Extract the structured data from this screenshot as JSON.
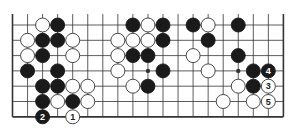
{
  "diagram": {
    "type": "go-board-fragment",
    "columns": 19,
    "rows_shown": 7,
    "edges": [
      "left",
      "right",
      "bottom"
    ],
    "colors": {
      "line": "#333333",
      "black_stone": "#1a1a1a",
      "white_stone": "#ffffff",
      "background": "#ffffff"
    },
    "star_points": [
      {
        "col": 9,
        "row": 3
      },
      {
        "col": 15,
        "row": 3
      }
    ],
    "stones": [
      {
        "col": 2,
        "row": 0,
        "color": "white"
      },
      {
        "col": 3,
        "row": 0,
        "color": "black"
      },
      {
        "col": 8,
        "row": 0,
        "color": "black"
      },
      {
        "col": 9,
        "row": 0,
        "color": "white"
      },
      {
        "col": 10,
        "row": 0,
        "color": "black"
      },
      {
        "col": 12,
        "row": 0,
        "color": "black"
      },
      {
        "col": 13,
        "row": 0,
        "color": "white"
      },
      {
        "col": 15,
        "row": 0,
        "color": "black"
      },
      {
        "col": 1,
        "row": 1,
        "color": "white"
      },
      {
        "col": 2,
        "row": 1,
        "color": "black"
      },
      {
        "col": 3,
        "row": 1,
        "color": "black"
      },
      {
        "col": 4,
        "row": 1,
        "color": "white"
      },
      {
        "col": 7,
        "row": 1,
        "color": "white"
      },
      {
        "col": 8,
        "row": 1,
        "color": "white"
      },
      {
        "col": 9,
        "row": 1,
        "color": "white"
      },
      {
        "col": 10,
        "row": 1,
        "color": "black"
      },
      {
        "col": 13,
        "row": 1,
        "color": "black"
      },
      {
        "col": 1,
        "row": 2,
        "color": "white"
      },
      {
        "col": 2,
        "row": 2,
        "color": "black"
      },
      {
        "col": 4,
        "row": 2,
        "color": "white"
      },
      {
        "col": 7,
        "row": 2,
        "color": "white"
      },
      {
        "col": 8,
        "row": 2,
        "color": "black"
      },
      {
        "col": 9,
        "row": 2,
        "color": "black"
      },
      {
        "col": 12,
        "row": 2,
        "color": "white"
      },
      {
        "col": 15,
        "row": 2,
        "color": "black"
      },
      {
        "col": 1,
        "row": 3,
        "color": "black"
      },
      {
        "col": 3,
        "row": 3,
        "color": "black"
      },
      {
        "col": 7,
        "row": 3,
        "color": "white"
      },
      {
        "col": 10,
        "row": 3,
        "color": "black"
      },
      {
        "col": 13,
        "row": 3,
        "color": "white"
      },
      {
        "col": 16,
        "row": 3,
        "color": "black"
      },
      {
        "col": 17,
        "row": 3,
        "color": "black",
        "label": "4"
      },
      {
        "col": 2,
        "row": 4,
        "color": "black"
      },
      {
        "col": 3,
        "row": 4,
        "color": "black"
      },
      {
        "col": 4,
        "row": 4,
        "color": "white"
      },
      {
        "col": 5,
        "row": 4,
        "color": "white"
      },
      {
        "col": 8,
        "row": 4,
        "color": "white"
      },
      {
        "col": 9,
        "row": 4,
        "color": "black"
      },
      {
        "col": 15,
        "row": 4,
        "color": "white"
      },
      {
        "col": 16,
        "row": 4,
        "color": "black"
      },
      {
        "col": 17,
        "row": 4,
        "color": "white",
        "label": "3"
      },
      {
        "col": 2,
        "row": 5,
        "color": "black"
      },
      {
        "col": 3,
        "row": 5,
        "color": "white"
      },
      {
        "col": 4,
        "row": 5,
        "color": "black"
      },
      {
        "col": 5,
        "row": 5,
        "color": "white"
      },
      {
        "col": 14,
        "row": 5,
        "color": "white"
      },
      {
        "col": 16,
        "row": 5,
        "color": "white"
      },
      {
        "col": 17,
        "row": 5,
        "color": "white",
        "label": "5"
      },
      {
        "col": 2,
        "row": 6,
        "color": "black",
        "label": "2"
      },
      {
        "col": 4,
        "row": 6,
        "color": "white",
        "label": "1"
      }
    ]
  }
}
